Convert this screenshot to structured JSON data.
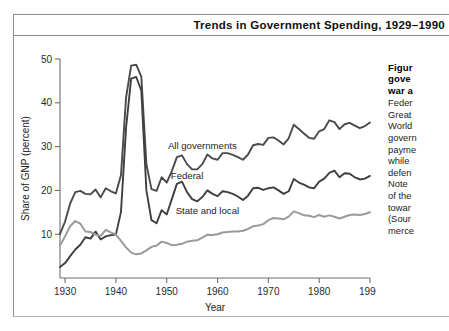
{
  "figure": {
    "title": "Trends in Government Spending, 1929–1990"
  },
  "caption": {
    "heading_lines": [
      "Figur",
      "gove",
      "war a"
    ],
    "body_lines": [
      "Feder",
      "Great",
      "World",
      "govern",
      "payme",
      "while",
      "defen",
      "Note",
      "of the",
      "towar",
      "(Sour",
      "merce"
    ]
  },
  "chart_data": {
    "type": "line",
    "title": "Trends in Government Spending, 1929–1990",
    "xlabel": "Year",
    "ylabel": "Share of GNP (percent)",
    "xlim": [
      1929,
      1990
    ],
    "ylim": [
      0,
      50
    ],
    "xticks": [
      1930,
      1940,
      1950,
      1960,
      1970,
      1980,
      1990
    ],
    "yticks": [
      10,
      20,
      30,
      40,
      50
    ],
    "grid": false,
    "legend": "inline-labels",
    "colors": {
      "all_governments": "#4a4a4a",
      "federal": "#3f3f3f",
      "state_and_local": "#9a9a9a"
    },
    "annotations": [
      {
        "text": "All governments",
        "x": 1957,
        "y": 29.5
      },
      {
        "text": "Federal",
        "x": 1954,
        "y": 22.5
      },
      {
        "text": "State and local",
        "x": 1958,
        "y": 14.5
      }
    ],
    "x": [
      1929,
      1930,
      1931,
      1932,
      1933,
      1934,
      1935,
      1936,
      1937,
      1938,
      1939,
      1940,
      1941,
      1942,
      1943,
      1944,
      1945,
      1946,
      1947,
      1948,
      1949,
      1950,
      1951,
      1952,
      1953,
      1954,
      1955,
      1956,
      1957,
      1958,
      1959,
      1960,
      1961,
      1962,
      1963,
      1964,
      1965,
      1966,
      1967,
      1968,
      1969,
      1970,
      1971,
      1972,
      1973,
      1974,
      1975,
      1976,
      1977,
      1978,
      1979,
      1980,
      1981,
      1982,
      1983,
      1984,
      1985,
      1986,
      1987,
      1988,
      1989,
      1990
    ],
    "series": [
      {
        "name": "All governments",
        "values": [
          10.0,
          12.9,
          17.0,
          19.6,
          19.9,
          19.2,
          19.1,
          20.2,
          18.4,
          20.5,
          19.8,
          19.3,
          23.5,
          41.2,
          48.5,
          48.7,
          46.0,
          26.0,
          20.3,
          19.9,
          23.0,
          21.8,
          24.4,
          27.6,
          28.0,
          26.0,
          24.8,
          24.8,
          26.0,
          28.2,
          27.3,
          27.0,
          28.5,
          28.5,
          28.1,
          27.6,
          27.0,
          28.2,
          30.3,
          30.6,
          30.4,
          32.0,
          32.1,
          31.4,
          30.5,
          31.9,
          35.0,
          34.0,
          33.0,
          32.0,
          31.8,
          33.5,
          34.0,
          36.0,
          35.6,
          34.0,
          35.1,
          35.4,
          34.8,
          34.2,
          34.7,
          35.5
        ]
      },
      {
        "name": "Federal",
        "values": [
          2.5,
          3.4,
          5.0,
          6.5,
          7.6,
          9.3,
          9.0,
          10.6,
          8.8,
          9.5,
          9.8,
          9.9,
          15.1,
          34.3,
          45.5,
          45.9,
          42.8,
          20.0,
          13.2,
          12.5,
          15.5,
          14.5,
          18.0,
          21.5,
          22.0,
          19.6,
          18.0,
          17.5,
          18.5,
          20.0,
          19.2,
          18.7,
          19.8,
          19.6,
          19.2,
          18.6,
          17.8,
          18.8,
          20.5,
          20.6,
          20.1,
          20.5,
          20.7,
          20.0,
          19.2,
          19.8,
          22.6,
          21.8,
          21.3,
          20.7,
          20.5,
          22.0,
          22.7,
          24.0,
          24.5,
          23.0,
          23.9,
          23.8,
          23.0,
          22.5,
          22.7,
          23.3
        ]
      },
      {
        "name": "State and local",
        "values": [
          7.4,
          9.5,
          11.8,
          13.0,
          12.4,
          10.6,
          10.5,
          9.9,
          9.6,
          11.0,
          10.4,
          9.9,
          8.5,
          7.0,
          5.8,
          5.4,
          5.6,
          6.3,
          7.1,
          7.4,
          8.3,
          8.0,
          7.5,
          7.6,
          7.8,
          8.3,
          8.5,
          8.6,
          9.2,
          9.9,
          9.8,
          10.0,
          10.4,
          10.5,
          10.6,
          10.6,
          10.8,
          11.2,
          11.8,
          12.0,
          12.3,
          13.2,
          13.7,
          13.6,
          13.4,
          14.0,
          15.2,
          14.8,
          14.3,
          14.2,
          13.9,
          14.4,
          14.0,
          14.3,
          14.0,
          13.6,
          14.0,
          14.4,
          14.5,
          14.4,
          14.6,
          15.0
        ]
      }
    ]
  }
}
